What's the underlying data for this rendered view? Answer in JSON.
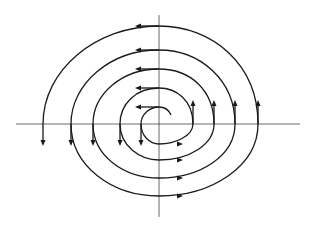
{
  "figure": {
    "type": "phase-portrait",
    "colors": {
      "background": "#ffffff",
      "curve": "#1a1a1a",
      "axes": "#444444"
    },
    "origin": {
      "x": 159,
      "y": 124
    },
    "axes": {
      "horizontal": {
        "x1": 16,
        "x2": 300,
        "y": 124
      },
      "vertical": {
        "x": 159,
        "y1": 15,
        "y2": 217
      }
    },
    "spiral": {
      "direction": "counterclockwise-outward",
      "start": {
        "x": 171,
        "y": 115
      },
      "crossings": {
        "top_y": [
          107,
          88,
          69,
          50,
          26
        ],
        "bottom_y": [
          144,
          160,
          178,
          196
        ],
        "left_x": [
          141,
          120,
          93,
          71,
          43
        ],
        "right_x": [
          193,
          214,
          235,
          258
        ]
      }
    },
    "arrows": {
      "left_pointing_at_x": 140,
      "right_pointing_at_x": 178,
      "down_pointing_at_y": 144,
      "up_pointing_at_y": 103
    }
  }
}
